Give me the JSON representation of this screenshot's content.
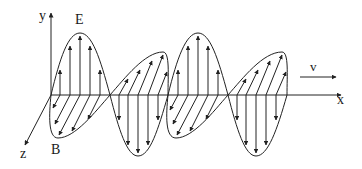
{
  "diagram": {
    "labels": {
      "y_axis": "y",
      "x_axis": "x",
      "z_axis": "z",
      "electric_field": "E",
      "magnetic_field": "B",
      "velocity": "v"
    },
    "colors": {
      "stroke": "#222222",
      "background": "#ffffff"
    },
    "geometry": {
      "origin": [
        51,
        95
      ],
      "e_wave": {
        "peaks": [
          [
            80,
            33
          ],
          [
            198,
            33
          ]
        ],
        "troughs": [
          [
            138,
            156
          ],
          [
            256,
            156
          ]
        ],
        "zero_crossings_x": [
          51,
          110,
          168,
          228,
          287
        ]
      },
      "b_wave": {
        "back_lobes_peaks": [
          [
            163,
            52
          ],
          [
            282,
            52
          ]
        ],
        "front_lobes_bottoms": [
          [
            55,
            138
          ],
          [
            173,
            138
          ]
        ]
      }
    }
  }
}
